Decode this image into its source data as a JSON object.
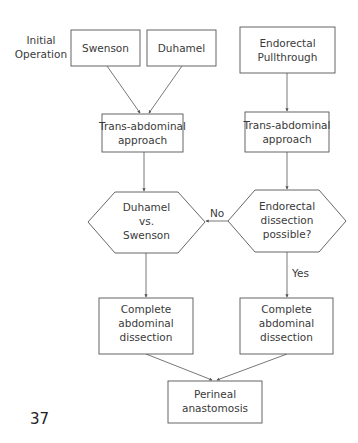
{
  "side_label": {
    "lines": [
      "Initial",
      "Operation"
    ]
  },
  "nodes": {
    "swenson": {
      "lines": [
        "Swenson"
      ]
    },
    "duhamel": {
      "lines": [
        "Duhamel"
      ]
    },
    "endorectal": {
      "lines": [
        "Endorectal",
        "Pullthrough"
      ]
    },
    "trans_left": {
      "lines": [
        "Trans-abdominal",
        "approach"
      ]
    },
    "trans_right": {
      "lines": [
        "Trans-abdominal",
        "approach"
      ]
    },
    "decision_left": {
      "lines": [
        "Duhamel",
        "vs.",
        "Swenson"
      ]
    },
    "decision_right": {
      "lines": [
        "Endorectal",
        "dissection",
        "possible?"
      ]
    },
    "complete_left": {
      "lines": [
        "Complete",
        "abdominal",
        "dissection"
      ]
    },
    "complete_right": {
      "lines": [
        "Complete",
        "abdominal",
        "dissection"
      ]
    },
    "perineal": {
      "lines": [
        "Perineal",
        "anastomosis"
      ]
    }
  },
  "edge_labels": {
    "no": "No",
    "yes": "Yes"
  },
  "page_number": "37",
  "colors": {
    "stroke": "#555555",
    "text": "#3a3a3a",
    "background": "#ffffff"
  }
}
